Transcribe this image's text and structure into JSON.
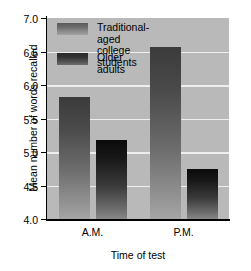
{
  "chart_data": {
    "type": "bar",
    "title": "",
    "xlabel": "Time of test",
    "ylabel": "Mean number of words recalled",
    "categories": [
      "A.M.",
      "P.M."
    ],
    "series": [
      {
        "name": "Traditional-aged\ncollege students",
        "values": [
          5.82,
          6.57
        ]
      },
      {
        "name": "Older adults",
        "values": [
          5.18,
          4.75
        ]
      }
    ],
    "ylim": [
      4.0,
      7.0
    ],
    "yticks": [
      "4.0",
      "4.5",
      "5.0",
      "5.5",
      "6.0",
      "6.5",
      "7.0"
    ],
    "ytick_values": [
      4.0,
      4.5,
      5.0,
      5.5,
      6.0,
      6.5,
      7.0
    ],
    "grid": true,
    "legend_position": "upper-left-inside",
    "colors": {
      "plot_background": "#b9b9b9",
      "gridline": "#eeeeee",
      "series0_top": "#3b3b3b",
      "series0_bottom": "#a5a5a5",
      "series1_top": "#0b0b0b",
      "series1_bottom": "#888888",
      "axis": "#000000",
      "page_background": "#ffffff"
    }
  },
  "legend": {
    "items": [
      {
        "label": "Traditional-aged\ncollege students"
      },
      {
        "label": "Older adults"
      }
    ]
  },
  "axes": {
    "ylabel": "Mean number of words recalled",
    "xlabel": "Time of test",
    "ytick_labels": [
      "7.0",
      "6.5",
      "6.0",
      "5.5",
      "5.0",
      "4.5",
      "4.0"
    ],
    "xtick_labels": [
      "A.M.",
      "P.M."
    ]
  }
}
